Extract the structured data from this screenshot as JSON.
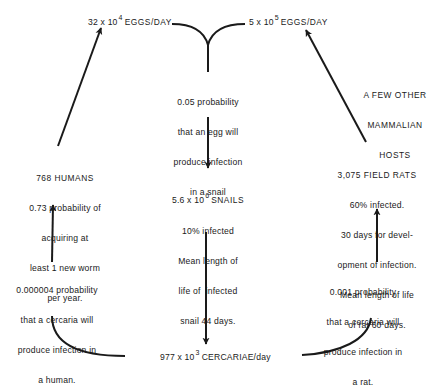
{
  "top": {
    "left_eggs": {
      "mantissa": "32 x 10",
      "exponent": "4",
      "unit": "EGGS/DAY"
    },
    "right_eggs": {
      "mantissa": "5 x 10",
      "exponent": "5",
      "unit": "EGGS/DAY"
    }
  },
  "center": {
    "egg_to_snail": [
      "0.05 probability",
      "that an egg will",
      "produce infection",
      "in a snail"
    ],
    "snails": {
      "mantissa": "5.6 x 10",
      "exponent": "6",
      "unit": "SNAILS",
      "details": [
        "10% infected",
        "Mean length of",
        "life of  infected",
        "snail 44 days."
      ]
    }
  },
  "bottom": {
    "cercariae": {
      "mantissa": "977 x 10",
      "exponent": "3",
      "unit": "CERCARIAE/day"
    }
  },
  "left": {
    "humans": [
      "768 HUMANS",
      "0.73 probability of",
      "acquiring at",
      "least 1 new worm",
      "per year."
    ],
    "cercaria_to_human": [
      "0.000004 probability",
      "that a cercaria will",
      "produce infection in",
      "a human."
    ]
  },
  "right": {
    "other_hosts": [
      "A FEW OTHER",
      "MAMMALIAN",
      "HOSTS"
    ],
    "rats": [
      "3,075 FIELD RATS",
      "60% infected.",
      "30 days for devel-",
      "opment of infection.",
      "Mean length of life",
      "of rat 60 days."
    ],
    "cercaria_to_rat": [
      "0.001 probability",
      "that a cercaria will",
      "produce infection in",
      "a rat."
    ]
  },
  "colors": {
    "ink": "#1a1a1a",
    "background": "#ffffff"
  }
}
